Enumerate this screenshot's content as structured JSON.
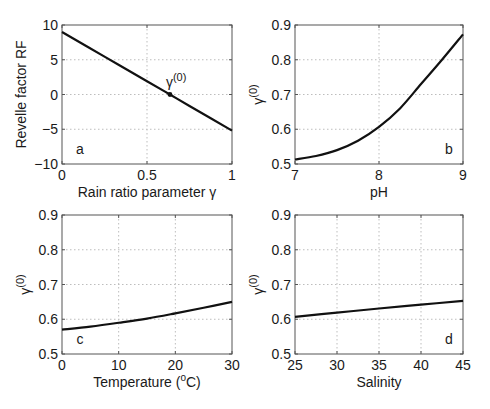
{
  "chart_data": [
    {
      "panel": "a",
      "type": "line",
      "xlabel": "Rain ratio parameter γ",
      "ylabel": "Revelle factor RF",
      "xlim": [
        0,
        1
      ],
      "ylim": [
        -10,
        10
      ],
      "xticks": [
        0,
        0.5,
        1
      ],
      "xtick_labels": [
        "0",
        "0.5",
        "1"
      ],
      "yticks": [
        -10,
        -5,
        0,
        5,
        10
      ],
      "ytick_labels": [
        "−10",
        "−5",
        "0",
        "5",
        "10"
      ],
      "grid": true,
      "x": [
        0,
        0.25,
        0.5,
        0.635,
        0.75,
        1
      ],
      "y": [
        9.0,
        5.45,
        1.9,
        0.0,
        -1.65,
        -5.2
      ],
      "annotations": [
        {
          "text": "γ(0)",
          "x": 0.635,
          "y": 0,
          "marker": true
        }
      ],
      "letter": "a",
      "letter_position": "bottom-left"
    },
    {
      "panel": "b",
      "type": "line",
      "xlabel": "pH",
      "ylabel": "γ(0)",
      "xlim": [
        7,
        9
      ],
      "ylim": [
        0.5,
        0.9
      ],
      "xticks": [
        7,
        8,
        9
      ],
      "xtick_labels": [
        "7",
        "8",
        "9"
      ],
      "yticks": [
        0.5,
        0.6,
        0.7,
        0.8,
        0.9
      ],
      "ytick_labels": [
        "0.5",
        "0.6",
        "0.7",
        "0.8",
        "0.9"
      ],
      "grid": true,
      "x": [
        7.0,
        7.25,
        7.5,
        7.75,
        8.0,
        8.25,
        8.5,
        8.75,
        9.0
      ],
      "y": [
        0.513,
        0.523,
        0.54,
        0.567,
        0.607,
        0.66,
        0.73,
        0.8,
        0.873
      ],
      "letter": "b",
      "letter_position": "bottom-right"
    },
    {
      "panel": "c",
      "type": "line",
      "xlabel": "Temperature (°C)",
      "ylabel": "γ(0)",
      "xlim": [
        0,
        30
      ],
      "ylim": [
        0.5,
        0.9
      ],
      "xticks": [
        0,
        10,
        20,
        30
      ],
      "xtick_labels": [
        "0",
        "10",
        "20",
        "30"
      ],
      "yticks": [
        0.5,
        0.6,
        0.7,
        0.8,
        0.9
      ],
      "ytick_labels": [
        "0.5",
        "0.6",
        "0.7",
        "0.8",
        "0.9"
      ],
      "grid": true,
      "x": [
        0,
        5,
        10,
        15,
        20,
        25,
        30
      ],
      "y": [
        0.57,
        0.579,
        0.59,
        0.602,
        0.617,
        0.633,
        0.65
      ],
      "letter": "c",
      "letter_position": "bottom-left"
    },
    {
      "panel": "d",
      "type": "line",
      "xlabel": "Salinity",
      "ylabel": "γ(0)",
      "xlim": [
        25,
        45
      ],
      "ylim": [
        0.5,
        0.9
      ],
      "xticks": [
        25,
        30,
        35,
        40,
        45
      ],
      "xtick_labels": [
        "25",
        "30",
        "35",
        "40",
        "45"
      ],
      "yticks": [
        0.5,
        0.6,
        0.7,
        0.8,
        0.9
      ],
      "ytick_labels": [
        "0.5",
        "0.6",
        "0.7",
        "0.8",
        "0.9"
      ],
      "grid": true,
      "x": [
        25,
        30,
        35,
        40,
        45
      ],
      "y": [
        0.607,
        0.619,
        0.631,
        0.642,
        0.653
      ],
      "letter": "d",
      "letter_position": "bottom-right"
    }
  ],
  "layout": {
    "panels": [
      {
        "left": 62,
        "top": 25,
        "right": 232,
        "bottom": 164
      },
      {
        "left": 295,
        "top": 25,
        "right": 463,
        "bottom": 164
      },
      {
        "left": 62,
        "top": 215,
        "right": 232,
        "bottom": 354
      },
      {
        "left": 295,
        "top": 215,
        "right": 463,
        "bottom": 354
      }
    ],
    "line_color": "#111111",
    "grid_color": "#bdbdbd",
    "axis_color": "#555555"
  }
}
